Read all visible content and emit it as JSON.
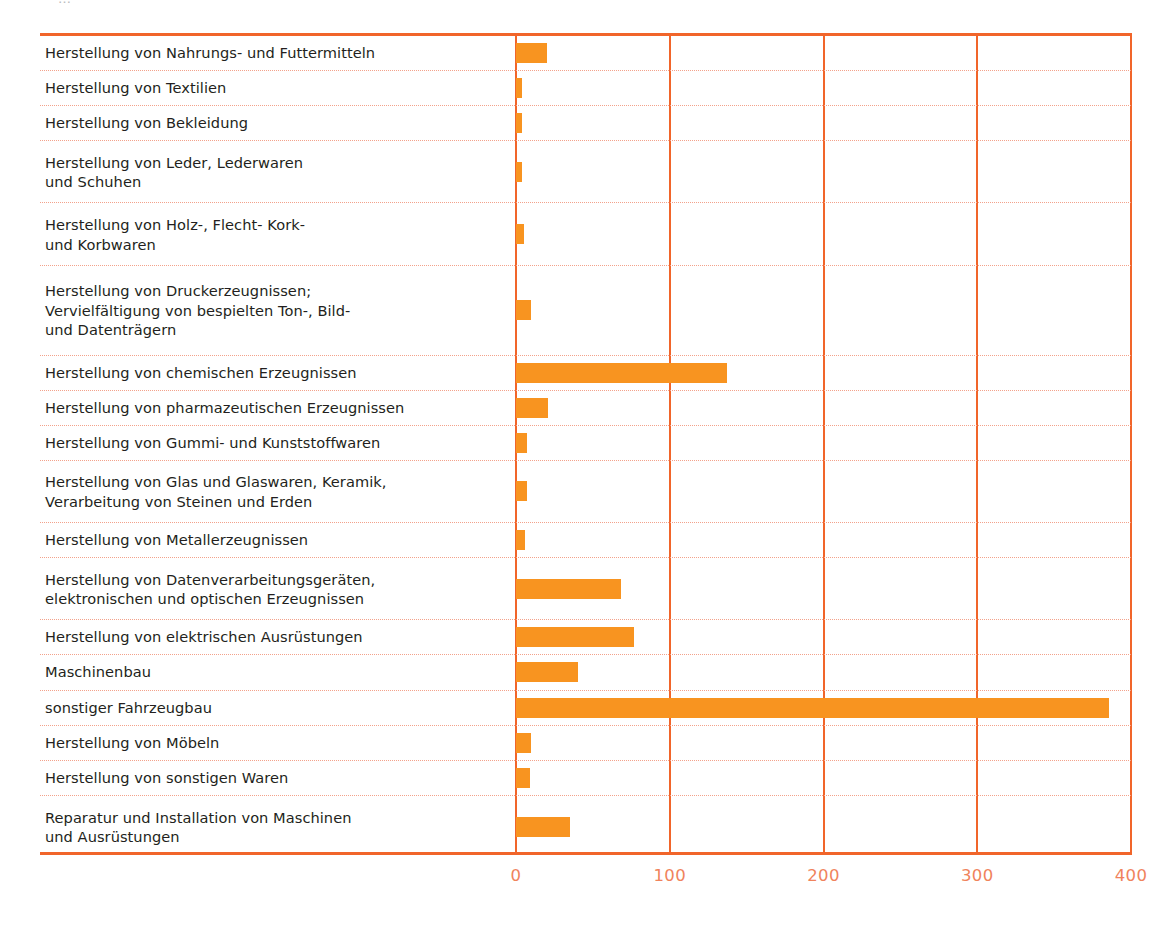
{
  "caption_remnant": "…",
  "colors": {
    "bar_fill": "#F89420",
    "frame_line": "#F1652A",
    "row_divider": "#F3A28B",
    "axis_label": "#F0835C",
    "category_text": "#231f20"
  },
  "chart_data": {
    "type": "bar",
    "orientation": "horizontal",
    "title": "",
    "xlabel": "",
    "ylabel": "",
    "xlim": [
      0,
      400
    ],
    "xticks": [
      "0",
      "100",
      "200",
      "300",
      "400"
    ],
    "grid": true,
    "legend": "none",
    "categories": [
      "Herstellung von Nahrungs- und Futtermitteln",
      "Herstellung von Textilien",
      "Herstellung von Bekleidung",
      "Herstellung von Leder, Lederwaren\nund Schuhen",
      "Herstellung von Holz-, Flecht- Kork-\nund Korbwaren",
      "Herstellung von Druckerzeugnissen;\nVervielfältigung von bespielten Ton-, Bild-\nund Datenträgern",
      "Herstellung von chemischen Erzeugnissen",
      "Herstellung von pharmazeutischen Erzeugnissen",
      "Herstellung von Gummi- und Kunststoffwaren",
      "Herstellung von Glas und Glaswaren, Keramik,\nVerarbeitung von Steinen und Erden",
      "Herstellung von Metallerzeugnissen",
      "Herstellung von Datenverarbeitungsgeräten,\nelektronischen und optischen Erzeugnissen",
      "Herstellung von elektrischen Ausrüstungen",
      "Maschinenbau",
      "sonstiger Fahrzeugbau",
      "Herstellung von Möbeln",
      "Herstellung von sonstigen Waren",
      "Reparatur und Installation von Maschinen\nund Ausrüstungen"
    ],
    "values": [
      20,
      4,
      4,
      4,
      5,
      10,
      137,
      21,
      7,
      7,
      6,
      68,
      77,
      40,
      386,
      10,
      9,
      35
    ]
  }
}
